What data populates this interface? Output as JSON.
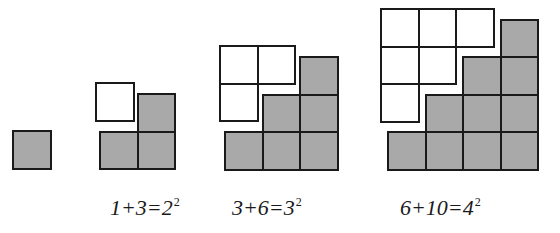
{
  "diagram": {
    "colors": {
      "gray_fill": "#a9a9a9",
      "white_fill": "#ffffff",
      "stroke": "#1a1a1a"
    },
    "cell_size": 37.5,
    "groups": [
      {
        "id": "n1",
        "label": null,
        "white": {
          "origin": [
            12,
            130
          ],
          "rows": []
        },
        "gray": {
          "origin": [
            12,
            167.5
          ],
          "heights": [
            1
          ]
        }
      },
      {
        "id": "n2",
        "label": {
          "lhs": "1+3=2",
          "exp": "2",
          "x": 110,
          "y": 193
        },
        "white": {
          "origin": [
            95,
            82
          ],
          "rows": [
            1
          ]
        },
        "gray": {
          "origin": [
            99,
            168
          ],
          "heights": [
            1,
            2
          ]
        }
      },
      {
        "id": "n3",
        "label": {
          "lhs": "3+6=3",
          "exp": "2",
          "x": 232,
          "y": 193
        },
        "white": {
          "origin": [
            219,
            45
          ],
          "rows": [
            2,
            1
          ]
        },
        "gray": {
          "origin": [
            224,
            168.5
          ],
          "heights": [
            1,
            2,
            3
          ]
        }
      },
      {
        "id": "n4",
        "label": {
          "lhs": "6+10=4",
          "exp": "2",
          "x": 400,
          "y": 193
        },
        "white": {
          "origin": [
            380,
            8
          ],
          "rows": [
            3,
            2,
            1
          ]
        },
        "gray": {
          "origin": [
            387,
            168.5
          ],
          "heights": [
            1,
            2,
            3,
            4
          ]
        }
      }
    ],
    "labels": {
      "n2": {
        "lhs": "1+3=2",
        "exp": "2"
      },
      "n3": {
        "lhs": "3+6=3",
        "exp": "2"
      },
      "n4": {
        "lhs": "6+10=4",
        "exp": "2"
      }
    }
  }
}
